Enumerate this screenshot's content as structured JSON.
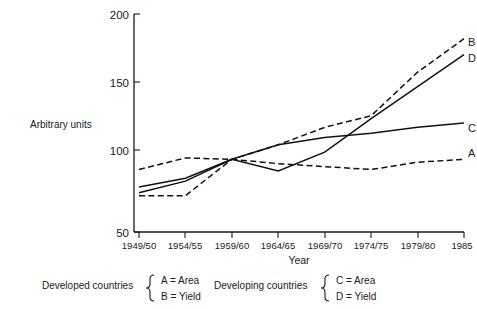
{
  "chart_data": {
    "type": "line",
    "title": "",
    "xlabel": "Year",
    "ylabel": "Arbitrary units",
    "categories": [
      "1949/50",
      "1954/55",
      "1959/60",
      "1964/65",
      "1969/70",
      "1974/75",
      "1979/80",
      "1985"
    ],
    "xtick_labels": [
      "1949/50",
      "1954/55",
      "1959/60",
      "1964/65",
      "1969/70",
      "1974/75",
      "1979/80",
      "1985"
    ],
    "ytick_labels": [
      "200",
      "150",
      "100",
      "50"
    ],
    "ytick_values": [
      200,
      150,
      100,
      50
    ],
    "ylim": [
      50,
      200
    ],
    "grid": false,
    "legend_position": "below-plot",
    "series": [
      {
        "name": "A",
        "label": "A",
        "style": "dashed",
        "group": "Developed countries",
        "measure": "Area",
        "values": [
          93,
          101,
          100,
          97,
          95,
          93,
          98,
          100
        ]
      },
      {
        "name": "B",
        "label": "B",
        "style": "dashed",
        "group": "Developed countries",
        "measure": "Yield",
        "values": [
          75,
          75,
          100,
          110,
          122,
          130,
          160,
          183
        ]
      },
      {
        "name": "C",
        "label": "C",
        "style": "solid",
        "group": "Developing countries",
        "measure": "Area",
        "values": [
          81,
          87,
          100,
          110,
          115,
          118,
          122,
          125
        ]
      },
      {
        "name": "D",
        "label": "D",
        "style": "solid",
        "group": "Developing countries",
        "measure": "Yield",
        "values": [
          77,
          85,
          100,
          92,
          105,
          128,
          150,
          172
        ]
      }
    ],
    "series_end_labels": [
      "B",
      "D",
      "C",
      "A"
    ]
  },
  "axis": {
    "y_label": "Arbitrary units",
    "x_label": "Year",
    "y_tick_200": "200",
    "y_tick_150": "150",
    "y_tick_100": "100",
    "y_tick_50": "50",
    "x_tick_0": "1949/50",
    "x_tick_1": "1954/55",
    "x_tick_2": "1959/60",
    "x_tick_3": "1964/65",
    "x_tick_4": "1969/70",
    "x_tick_5": "1974/75",
    "x_tick_6": "1979/80",
    "x_tick_7": "1985"
  },
  "series_labels": {
    "b": "B",
    "d": "D",
    "c": "C",
    "a": "A"
  },
  "legend": {
    "developed": {
      "group_label": "Developed countries",
      "entry_1": "A = Area",
      "entry_2": "B = Yield"
    },
    "developing": {
      "group_label": "Developing countries",
      "entry_1": "C = Area",
      "entry_2": "D = Yield"
    }
  },
  "colors": {
    "ink": "#111111",
    "background": "#ffffff"
  }
}
